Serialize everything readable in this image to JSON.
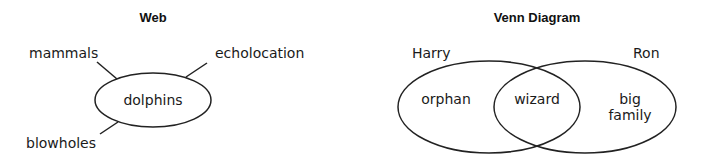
{
  "web": {
    "title": "Web",
    "center": "dolphins",
    "branches": [
      "mammals",
      "echolocation",
      "blowholes"
    ]
  },
  "venn": {
    "title": "Venn Diagram",
    "left_set": "Harry",
    "right_set": "Ron",
    "left_only": "orphan",
    "intersection": "wizard",
    "right_only_line1": "big",
    "right_only_line2": "family"
  },
  "colors": {
    "stroke": "#222222",
    "text": "#1a1a1a"
  }
}
